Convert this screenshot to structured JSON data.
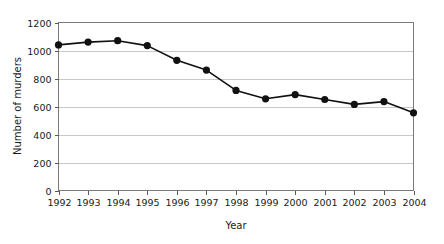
{
  "chart_data": {
    "type": "line",
    "title": "",
    "xlabel": "Year",
    "ylabel": "Number of murders",
    "categories": [
      "1992",
      "1993",
      "1994",
      "1995",
      "1996",
      "1997",
      "1998",
      "1999",
      "2000",
      "2001",
      "2002",
      "2003",
      "2004"
    ],
    "values": [
      1040,
      1060,
      1070,
      1035,
      930,
      860,
      715,
      655,
      685,
      650,
      615,
      635,
      555
    ],
    "series": [
      {
        "name": "Number of murders",
        "values": [
          1040,
          1060,
          1070,
          1035,
          930,
          860,
          715,
          655,
          685,
          650,
          615,
          635,
          555
        ]
      }
    ],
    "ylim": [
      0,
      1200
    ],
    "ytick_values": [
      0,
      200,
      400,
      600,
      800,
      1000,
      1200
    ],
    "ytick_labels": [
      "0",
      "200",
      "400",
      "600",
      "800",
      "1000",
      "1200"
    ],
    "xtick_labels": [
      "1992",
      "1993",
      "1994",
      "1995",
      "1996",
      "1997",
      "1998",
      "1999",
      "2000",
      "2001",
      "2002",
      "2003",
      "2004"
    ],
    "grid": "horizontal",
    "legend": "none",
    "marker": "filled-circle",
    "line_color": "#111111",
    "marker_color": "#111111",
    "grid_color": "#c8c8c8",
    "frame_color": "#7a7a7a",
    "background_color": "#ffffff"
  },
  "labels": {
    "y_axis_title": "Number of murders",
    "x_axis_title": "Year"
  }
}
